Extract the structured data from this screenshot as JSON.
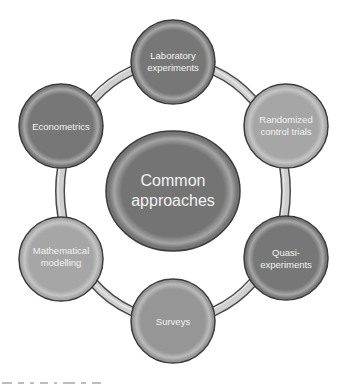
{
  "diagram": {
    "type": "cycle",
    "center": {
      "label_line1": "Common",
      "label_line2": "approaches",
      "color": "#747474"
    },
    "nodes": [
      {
        "id": "laboratory",
        "line1": "Laboratory",
        "line2": "experiments",
        "color": "#777777"
      },
      {
        "id": "randomized",
        "line1": "Randomized",
        "line2": "control trials",
        "color": "#a6a6a6"
      },
      {
        "id": "quasi",
        "line1": "Quasi-",
        "line2": "experiments",
        "color": "#777777"
      },
      {
        "id": "surveys",
        "line1": "Surveys",
        "line2": "",
        "color": "#969696"
      },
      {
        "id": "mathematical",
        "line1": "Mathematical",
        "line2": "modelling",
        "color": "#a6a6a6"
      },
      {
        "id": "econometrics",
        "line1": "Econometrics",
        "line2": "",
        "color": "#777777"
      }
    ],
    "ring_color": "#cfcfcf",
    "outline_color": "#4a4a4a",
    "label_color": "#f2f2f2"
  }
}
